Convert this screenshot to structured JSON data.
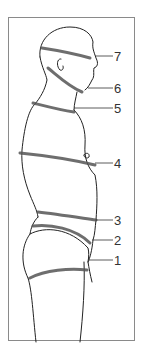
{
  "diagram": {
    "type": "anatomical-figure",
    "labels": [
      {
        "id": "7",
        "text": "7",
        "y": 50
      },
      {
        "id": "6",
        "text": "6",
        "y": 82
      },
      {
        "id": "5",
        "text": "5",
        "y": 102
      },
      {
        "id": "4",
        "text": "4",
        "y": 157
      },
      {
        "id": "3",
        "text": "3",
        "y": 214
      },
      {
        "id": "2",
        "text": "2",
        "y": 234
      },
      {
        "id": "1",
        "text": "1",
        "y": 254
      }
    ],
    "colors": {
      "frame": "#8a8a8a",
      "ink": "#222222",
      "band": "#555555",
      "label": "#333333"
    }
  }
}
